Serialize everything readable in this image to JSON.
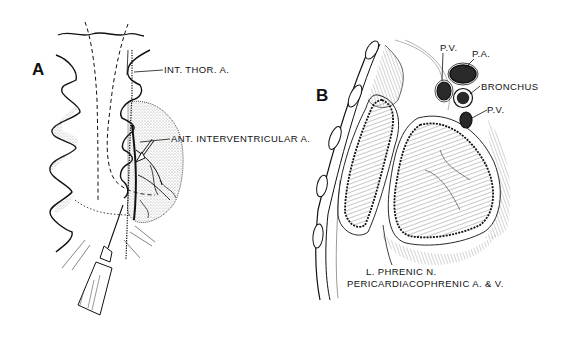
{
  "figure": {
    "panels": [
      {
        "id": "A",
        "letter": "A",
        "labels": {
          "int_thor": "INT. THOR. A.",
          "ant_interventricular": "ANT. INTERVENTRICULAR A."
        }
      },
      {
        "id": "B",
        "letter": "B",
        "labels": {
          "pv_top": "P.V.",
          "pa": "P.A.",
          "bronchus": "BRONCHUS",
          "pv_bottom": "P.V.",
          "phrenic": "L. PHRENIC N.",
          "pericardiacophrenic": "PERICARDIACOPHRENIC A. & V."
        }
      }
    ],
    "colors": {
      "ink": "#111111",
      "background": "#ffffff",
      "stipple": "#9a9a9a",
      "vessel_dark": "#2a2a2a"
    }
  }
}
